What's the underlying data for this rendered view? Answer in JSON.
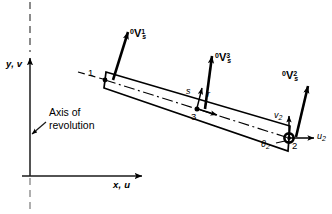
{
  "figure": {
    "kind": "axisymmetric-shell-element-diagram",
    "background": "#ffffff",
    "ink": "#000000"
  },
  "axes": {
    "vertical_label": "y, v",
    "horizontal_label": "x, u",
    "origin": {
      "x": 30,
      "y": 176
    },
    "vertical_top": {
      "x": 30,
      "y": 0
    },
    "vertical_arrow_tip": {
      "x": 30,
      "y": 56
    },
    "horizontal_arrow_tip": {
      "x": 146,
      "y": 176
    }
  },
  "annotation": {
    "line1": "Axis of",
    "line2": "revolution",
    "leader_from": {
      "x": 44,
      "y": 124
    },
    "leader_to": {
      "x": 31,
      "y": 134
    }
  },
  "element": {
    "outline": [
      {
        "x": 106,
        "y": 72
      },
      {
        "x": 290,
        "y": 126
      },
      {
        "x": 288,
        "y": 151
      },
      {
        "x": 104,
        "y": 88
      }
    ],
    "centerline": [
      {
        "x": 105,
        "y": 80
      },
      {
        "x": 289,
        "y": 138
      }
    ],
    "extension_dashes": [
      {
        "x": 80,
        "y": 72
      },
      {
        "x": 104,
        "y": 79
      }
    ]
  },
  "nodes": [
    {
      "id": "node-1",
      "label": "1",
      "x": 105,
      "y": 80,
      "label_x": 90,
      "label_y": 73,
      "marker": "arrow-tail"
    },
    {
      "id": "node-3",
      "label": "3",
      "x": 197,
      "y": 109,
      "label_x": 191,
      "label_y": 112,
      "marker": "dot"
    },
    {
      "id": "node-2",
      "label": "2",
      "x": 289,
      "y": 138,
      "label_x": 292,
      "label_y": 140,
      "marker": "hub"
    }
  ],
  "director_vectors": [
    {
      "id": "director-vector-node-1",
      "pre": "0",
      "base": "V",
      "sub": "s",
      "sup": "1",
      "tail": {
        "x": 113,
        "y": 79
      },
      "tip": {
        "x": 128,
        "y": 30
      },
      "label_x": 131,
      "label_y": 33
    },
    {
      "id": "director-vector-node-3",
      "pre": "0",
      "base": "V",
      "sub": "s",
      "sup": "3",
      "tail": {
        "x": 205,
        "y": 108
      },
      "tip": {
        "x": 212,
        "y": 54
      },
      "label_x": 216,
      "label_y": 55
    },
    {
      "id": "director-vector-node-2",
      "pre": "0",
      "base": "V",
      "sub": "s",
      "sup": "2",
      "tail": {
        "x": 296,
        "y": 136
      },
      "tip": {
        "x": 308,
        "y": 84
      },
      "label_x": 283,
      "label_y": 73
    }
  ],
  "local_axes": {
    "s_label": "s",
    "r_label": "r",
    "s_tail": {
      "x": 197,
      "y": 108
    },
    "s_tip": {
      "x": 203,
      "y": 86
    },
    "r_tail": {
      "x": 197,
      "y": 109
    },
    "r_tip": {
      "x": 219,
      "y": 116
    },
    "s_label_x": 188,
    "s_label_y": 92,
    "r_label_x": 208,
    "r_label_y": 95
  },
  "dof": {
    "v_label": "v",
    "v_sub": "2",
    "u_label": "u",
    "u_sub": "2",
    "theta_label": "θ",
    "theta_sub": "2",
    "v_arrow_tail": {
      "x": 289,
      "y": 138
    },
    "v_arrow_tip": {
      "x": 289,
      "y": 114
    },
    "u_arrow_tail": {
      "x": 289,
      "y": 138
    },
    "u_arrow_tip": {
      "x": 316,
      "y": 138
    },
    "v_label_x": 276,
    "v_label_y": 115,
    "u_label_x": 318,
    "u_label_y": 133,
    "theta_label_x": 264,
    "theta_label_y": 141
  }
}
